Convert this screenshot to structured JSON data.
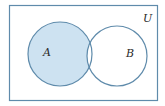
{
  "diagram": {
    "type": "venn",
    "universe_label": "U",
    "sets": [
      {
        "name": "A",
        "label": "A"
      },
      {
        "name": "B",
        "label": "B"
      }
    ],
    "shaded_region": "A minus B",
    "colors": {
      "stroke": "#5f8bab",
      "shade": "#cde2f1",
      "background": "#ffffff"
    }
  }
}
